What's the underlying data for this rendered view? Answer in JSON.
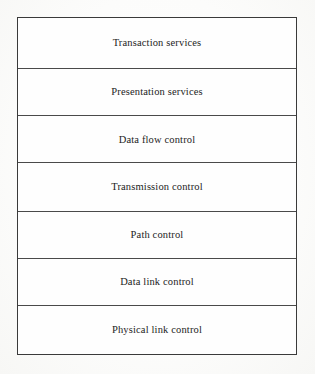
{
  "diagram": {
    "shape": "vertical-stack",
    "border_color": "#3a3a3a",
    "divider_color": "#4a4a4a",
    "text_color": "#232323",
    "background_color": "#fefefe",
    "page_background": "#fdfdfc",
    "layer_count": 7,
    "layers": [
      {
        "index": 1,
        "label": "Transaction services",
        "height_px": 51
      },
      {
        "index": 2,
        "label": "Presentation services",
        "height_px": 48
      },
      {
        "index": 3,
        "label": "Data flow control",
        "height_px": 47
      },
      {
        "index": 4,
        "label": "Transmission control",
        "height_px": 49
      },
      {
        "index": 5,
        "label": "Path control",
        "height_px": 47
      },
      {
        "index": 6,
        "label": "Data link control",
        "height_px": 48
      },
      {
        "index": 7,
        "label": "Physical link control",
        "height_px": 48
      }
    ]
  }
}
